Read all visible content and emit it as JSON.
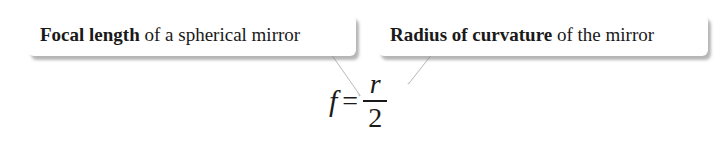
{
  "callouts": [
    {
      "bold": "Focal length",
      "rest": " of a spherical mirror",
      "points_to": "f"
    },
    {
      "bold": "Radius of curvature",
      "rest": " of the mirror",
      "points_to": "r"
    }
  ],
  "formula": {
    "lhs": "f",
    "equals": "=",
    "numerator": "r",
    "denominator": "2"
  }
}
